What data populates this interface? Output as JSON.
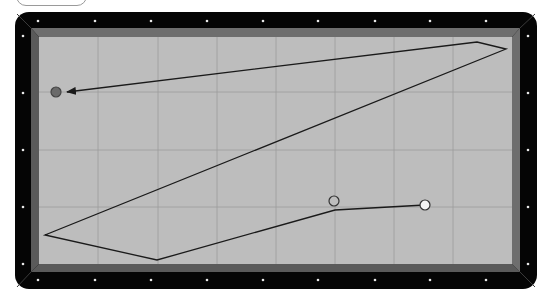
{
  "game": {
    "type": "three-cushion billiards diagram",
    "colors": {
      "rail": "#050505",
      "cushion": "#5a5a5a",
      "cushion_light": "#6e6e6e",
      "felt": "#bdbdbd",
      "grid": "#9c9c9c",
      "path": "#1a1a1a",
      "diamond": "#e8e8e8"
    },
    "table": {
      "frame": {
        "x": 15,
        "y": 12,
        "w": 522,
        "h": 277,
        "radius": 14
      },
      "cushion_outer": {
        "x": 31,
        "y": 28,
        "w": 489,
        "h": 244
      },
      "felt": {
        "x": 39,
        "y": 37,
        "w": 473,
        "h": 227
      }
    },
    "grid": {
      "vertical": [
        98,
        158,
        217,
        276,
        335,
        394,
        453
      ],
      "horizontal": [
        92,
        150,
        207
      ]
    },
    "diamonds": {
      "top": [
        [
          38,
          21
        ],
        [
          95,
          21
        ],
        [
          151,
          21
        ],
        [
          207,
          21
        ],
        [
          263,
          21
        ],
        [
          318,
          21
        ],
        [
          375,
          21
        ],
        [
          430,
          21
        ],
        [
          486,
          21
        ]
      ],
      "bottom": [
        [
          38,
          280
        ],
        [
          95,
          280
        ],
        [
          151,
          280
        ],
        [
          207,
          280
        ],
        [
          263,
          280
        ],
        [
          318,
          280
        ],
        [
          375,
          280
        ],
        [
          430,
          280
        ],
        [
          486,
          280
        ]
      ],
      "left": [
        [
          23,
          36
        ],
        [
          23,
          93
        ],
        [
          23,
          150
        ],
        [
          23,
          207
        ],
        [
          23,
          264
        ]
      ],
      "right": [
        [
          528,
          36
        ],
        [
          528,
          93
        ],
        [
          528,
          150
        ],
        [
          528,
          207
        ],
        [
          528,
          264
        ]
      ]
    },
    "balls": [
      {
        "name": "cue-ball",
        "x": 425,
        "y": 205,
        "r": 5,
        "fill": "#f4f4f4",
        "stroke": "#333333"
      },
      {
        "name": "object-ball-1",
        "x": 334,
        "y": 201,
        "r": 5,
        "fill": "#bdbdbd",
        "stroke": "#333333"
      },
      {
        "name": "object-ball-2",
        "x": 56,
        "y": 92,
        "r": 5,
        "fill": "#6a6a6a",
        "stroke": "#444444"
      }
    ],
    "path": {
      "points": [
        [
          425,
          205
        ],
        [
          335,
          210
        ],
        [
          157,
          260
        ],
        [
          45,
          235
        ],
        [
          506,
          49
        ],
        [
          477,
          42
        ],
        [
          67,
          92
        ]
      ],
      "arrow_end": true
    }
  }
}
